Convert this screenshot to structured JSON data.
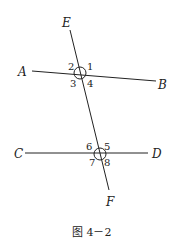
{
  "figure": {
    "caption": "图 4－2",
    "points": {
      "A": "A",
      "B": "B",
      "C": "C",
      "D": "D",
      "E": "E",
      "F": "F"
    },
    "angles_top": [
      "1",
      "2",
      "3",
      "4"
    ],
    "angles_bottom": [
      "5",
      "6",
      "7",
      "8"
    ],
    "lines": [
      {
        "name": "AB",
        "from": "A",
        "to": "B"
      },
      {
        "name": "CD",
        "from": "C",
        "to": "D"
      },
      {
        "name": "EF",
        "from": "E",
        "to": "F"
      }
    ]
  }
}
